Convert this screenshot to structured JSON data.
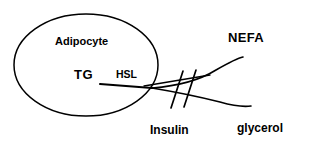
{
  "diagram": {
    "background_color": "#ffffff",
    "stroke_color": "#000000",
    "labels": {
      "cell": "Adipocyte",
      "substrate": "TG",
      "enzyme": "HSL",
      "product_primary": "NEFA",
      "product_secondary": "glycerol",
      "inhibitor": "Insulin"
    },
    "shapes": {
      "cell_outline": "ellipse",
      "inhibition_marker": "double-slash",
      "reaction_arrow": "branching-curve"
    }
  }
}
